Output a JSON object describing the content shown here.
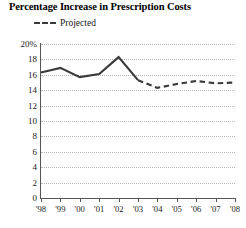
{
  "chart_data": {
    "type": "line",
    "title": "Percentage Increase in Prescription Costs",
    "xlabel": "",
    "ylabel": "",
    "ylim": [
      0,
      20
    ],
    "ytick_values": [
      0,
      2,
      4,
      6,
      8,
      10,
      12,
      14,
      16,
      18,
      20
    ],
    "ytick_labels": [
      "0",
      "2",
      "4",
      "6",
      "8",
      "10",
      "12",
      "14",
      "16",
      "18",
      "20%"
    ],
    "categories": [
      "'98",
      "'99",
      "'00",
      "'01",
      "'02",
      "'03",
      "'04",
      "'05",
      "'06",
      "'07",
      "'08"
    ],
    "grid": "horizontal-dotted",
    "legend_position": "top-left",
    "series": [
      {
        "name": "Actual",
        "style": "solid",
        "color": "#3a3a3a",
        "x": [
          "'98",
          "'99",
          "'00",
          "'01",
          "'02",
          "'03"
        ],
        "values": [
          16.3,
          16.9,
          15.7,
          16.1,
          18.3,
          15.3
        ]
      },
      {
        "name": "Projected",
        "style": "dashed",
        "color": "#3a3a3a",
        "x": [
          "'03",
          "'04",
          "'05",
          "'06",
          "'07",
          "'08"
        ],
        "values": [
          15.3,
          14.3,
          14.8,
          15.2,
          14.9,
          15.0
        ]
      }
    ],
    "legend": [
      {
        "label": "Projected",
        "style": "dashed",
        "color": "#3a3a3a"
      }
    ]
  },
  "colors": {
    "line": "#3a3a3a",
    "axis": "#555555",
    "grid": "#b9b9b9",
    "text": "#1a1a1a",
    "background": "#ffffff"
  }
}
